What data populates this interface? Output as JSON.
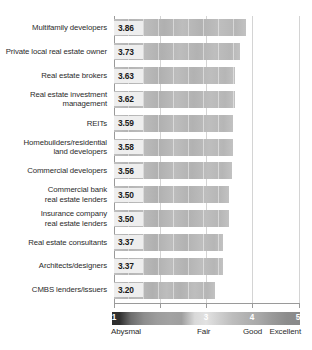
{
  "chart_data": {
    "type": "bar",
    "orientation": "horizontal",
    "title": "",
    "xlabel": "",
    "ylabel": "",
    "xlim": [
      1,
      5
    ],
    "grid": true,
    "gridlines": [
      1,
      2,
      3,
      4,
      5
    ],
    "categories": [
      "Multifamily developers",
      "Private local real estate owner",
      "Real estate brokers",
      "Real estate investment\nmanagement",
      "REITs",
      "Homebuilders/residential\nland developers",
      "Commercial developers",
      "Commercial bank\nreal estate lenders",
      "Insurance company\nreal estate lenders",
      "Real estate consultants",
      "Architects/designers",
      "CMBS lenders/issuers"
    ],
    "values": [
      3.86,
      3.73,
      3.63,
      3.62,
      3.59,
      3.58,
      3.56,
      3.5,
      3.5,
      3.37,
      3.37,
      3.2
    ],
    "value_labels": [
      "3.86",
      "3.73",
      "3.63",
      "3.62",
      "3.59",
      "3.58",
      "3.56",
      "3.50",
      "3.50",
      "3.37",
      "3.37",
      "3.20"
    ],
    "legend": {
      "position": "bottom",
      "ticks": [
        {
          "value": "1",
          "caption": "Abysmal"
        },
        {
          "value": "3",
          "caption": "Fair"
        },
        {
          "value": "4",
          "caption": "Good"
        },
        {
          "value": "5",
          "caption": "Excellent"
        }
      ]
    },
    "colors": {
      "bar_fill": "#b8b8b8",
      "value_box": "#eeeeee",
      "axis": "#9a9a9a",
      "gridline": "#d4d4d4",
      "text": "#2b2b2b"
    }
  }
}
